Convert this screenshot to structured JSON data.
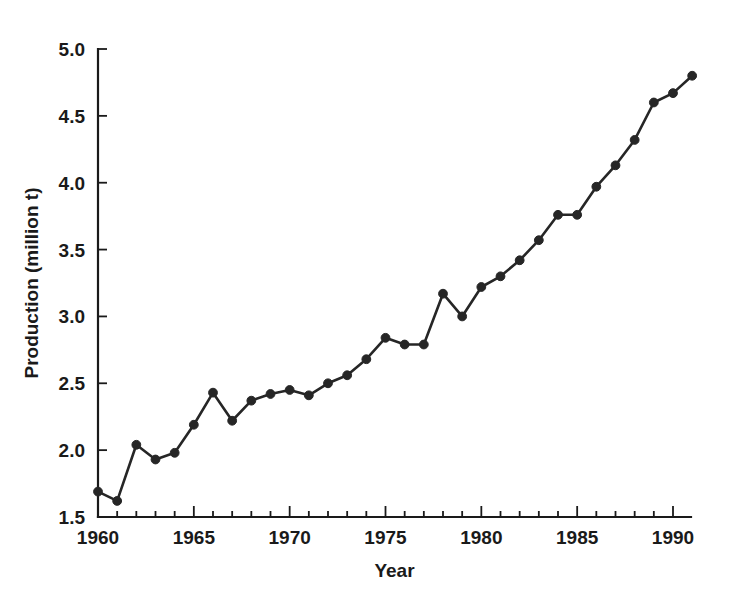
{
  "chart_data": {
    "type": "line",
    "title": "",
    "xlabel": "Year",
    "ylabel": "Production (million t)",
    "xlim": [
      1960,
      1991
    ],
    "ylim": [
      1.5,
      5.0
    ],
    "grid": false,
    "legend": null,
    "x_major_ticks": [
      1960,
      1965,
      1970,
      1975,
      1980,
      1985,
      1990
    ],
    "x_major_tick_labels": [
      "1960",
      "1965",
      "1970",
      "1975",
      "1980",
      "1985",
      "1990"
    ],
    "x_minor_tick_interval": 1,
    "y_ticks": [
      1.5,
      2.0,
      2.5,
      3.0,
      3.5,
      4.0,
      4.5,
      5.0
    ],
    "y_tick_labels": [
      "1.5",
      "2.0",
      "2.5",
      "3.0",
      "3.5",
      "4.0",
      "4.5",
      "5.0"
    ],
    "marker": "filled-circle",
    "line_color": "#262626",
    "marker_color": "#262626",
    "axis_color": "#1a1a1a",
    "background_color": "#ffffff",
    "x": [
      1960,
      1961,
      1962,
      1963,
      1964,
      1965,
      1966,
      1967,
      1968,
      1969,
      1970,
      1971,
      1972,
      1973,
      1974,
      1975,
      1976,
      1977,
      1978,
      1979,
      1980,
      1981,
      1982,
      1983,
      1984,
      1985,
      1986,
      1987,
      1988,
      1989,
      1990,
      1991
    ],
    "values": [
      1.69,
      1.62,
      2.04,
      1.93,
      1.98,
      2.19,
      2.43,
      2.22,
      2.37,
      2.42,
      2.45,
      2.41,
      2.5,
      2.56,
      2.68,
      2.84,
      2.79,
      2.79,
      3.17,
      3.0,
      3.22,
      3.3,
      3.42,
      3.57,
      3.76,
      3.76,
      3.97,
      4.13,
      4.32,
      4.6,
      4.67,
      4.8
    ],
    "series": [
      {
        "name": "Production",
        "values": [
          1.69,
          1.62,
          2.04,
          1.93,
          1.98,
          2.19,
          2.43,
          2.22,
          2.37,
          2.42,
          2.45,
          2.41,
          2.5,
          2.56,
          2.68,
          2.84,
          2.79,
          2.79,
          3.17,
          3.0,
          3.22,
          3.3,
          3.42,
          3.57,
          3.76,
          3.76,
          3.97,
          4.13,
          4.32,
          4.6,
          4.67,
          4.8
        ]
      }
    ]
  }
}
